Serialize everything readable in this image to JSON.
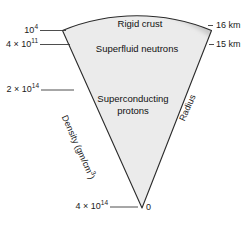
{
  "figure": {
    "colors": {
      "crust": "#8c8c8c",
      "neutrons": "#c9c9c9",
      "protons": "#ebebeb",
      "outline": "#2b2b2b",
      "leader": "#3a3a3a",
      "background": "#ffffff"
    }
  },
  "layers": [
    {
      "id": "crust",
      "label": "Rigid crust"
    },
    {
      "id": "neutrons",
      "label": "Superfluid neutrons"
    },
    {
      "id": "protons",
      "label": "Superconducting protons",
      "label_line1": "Superconducting",
      "label_line2": "protons"
    }
  ],
  "density_axis": {
    "label": "Density (gm/cm",
    "label_sup": "3",
    "label_tail": ")",
    "ticks": [
      {
        "mantissa": "10",
        "exponent": "4",
        "text": "10⁴"
      },
      {
        "mantissa": "4 × 10",
        "exponent": "11",
        "text": "4 × 10¹¹"
      },
      {
        "mantissa": "2 × 10",
        "exponent": "14",
        "text": "2 × 10¹⁴"
      },
      {
        "mantissa": "4 × 10",
        "exponent": "14",
        "text": "4 × 10¹⁴"
      }
    ]
  },
  "radius_axis": {
    "label": "Radius",
    "ticks": [
      {
        "text": "16 km"
      },
      {
        "text": "15 km"
      },
      {
        "text": "0"
      }
    ]
  }
}
